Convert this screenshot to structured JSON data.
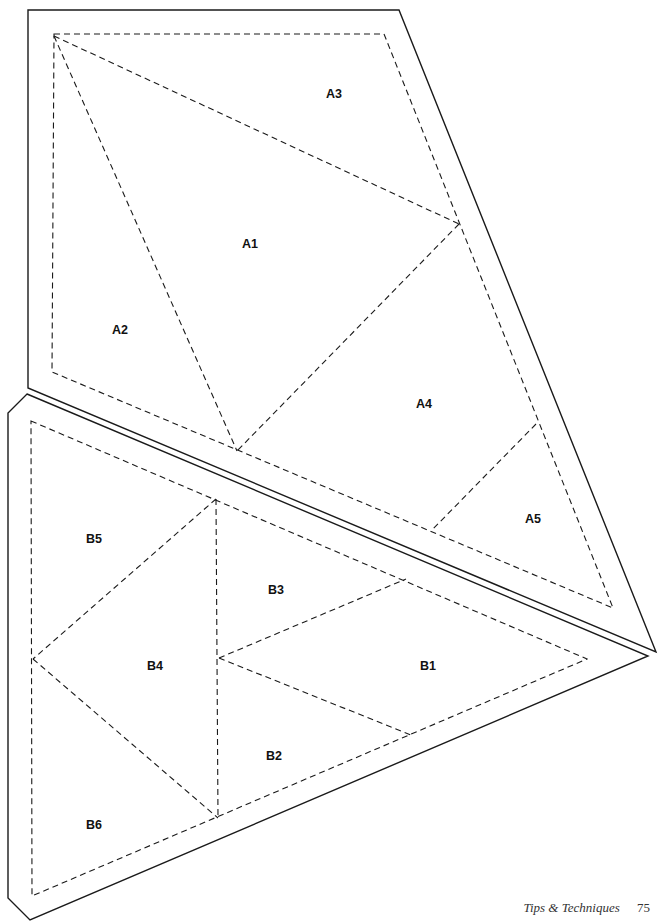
{
  "document": {
    "footer": {
      "section_title": "Tips & Techniques",
      "page_number": "75"
    },
    "templates": [
      {
        "unit": "A",
        "pieces": [
          "A1",
          "A2",
          "A3",
          "A4",
          "A5"
        ]
      },
      {
        "unit": "B",
        "pieces": [
          "B1",
          "B2",
          "B3",
          "B4",
          "B5",
          "B6"
        ]
      }
    ],
    "colors": {
      "line": "#1a1a1a",
      "background": "#ffffff"
    }
  }
}
